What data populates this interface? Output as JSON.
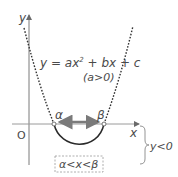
{
  "diagram": {
    "axes": {
      "y_label": "y",
      "x_label": "x",
      "origin_label": "O"
    },
    "equation": {
      "text_main": "y = ax",
      "exponent": "2",
      "text_rest": " + bx + c",
      "condition": "(a>0)"
    },
    "roots": {
      "alpha": "α",
      "beta": "β"
    },
    "solution_box": "α<x<β",
    "brace_label": "y<0",
    "colors": {
      "curve": "#2a2a2a",
      "axis": "#9a9a9a",
      "arrow": "#7a7a7a",
      "text": "#4a4a4a",
      "box_border": "#9a9a9a"
    }
  }
}
